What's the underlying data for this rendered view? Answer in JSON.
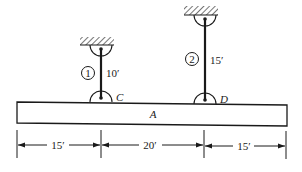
{
  "diagram": {
    "type": "rigid beam suspended by two vertical rods",
    "beam": {
      "label": "A"
    },
    "rods": [
      {
        "id": "1",
        "length_label": "10′",
        "attach_label": "C"
      },
      {
        "id": "2",
        "length_label": "15′",
        "attach_label": "D"
      }
    ],
    "dimensions": [
      {
        "label": "15′"
      },
      {
        "label": "20′"
      },
      {
        "label": "15′"
      }
    ]
  },
  "colors": {
    "ink": "#1a1a1a",
    "background": "#ffffff"
  }
}
